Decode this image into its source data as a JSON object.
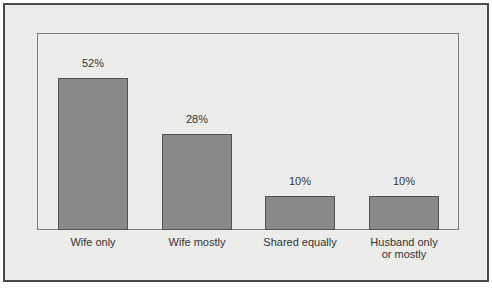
{
  "figure": {
    "colors": {
      "canvas_background": "#ffffff",
      "frame_fill": "#ececeb",
      "frame_border": "#4a4a4a",
      "plot_fill": "#ececeb",
      "plot_border": "#7d7d7d",
      "bar_fill": "#8a8a8a",
      "bar_border": "#525252",
      "text_color": "#333333"
    }
  },
  "chart_data": {
    "type": "bar",
    "title": "",
    "xlabel": "",
    "ylabel": "",
    "categories": [
      "Wife only",
      "Wife mostly",
      "Shared equally",
      "Husband only\nor mostly"
    ],
    "values": [
      52,
      28,
      10,
      10
    ],
    "value_labels": [
      "52%",
      "28%",
      "10%",
      "10%"
    ],
    "grid": false,
    "legend": false,
    "axes_shown": false,
    "layout": {
      "bar_width": 70,
      "bar_lefts": [
        53,
        157,
        260,
        364
      ],
      "bar_tops": [
        73,
        129,
        191,
        191
      ],
      "baseline": 225,
      "value_label_offset": 21,
      "category_label_top": 231
    }
  }
}
